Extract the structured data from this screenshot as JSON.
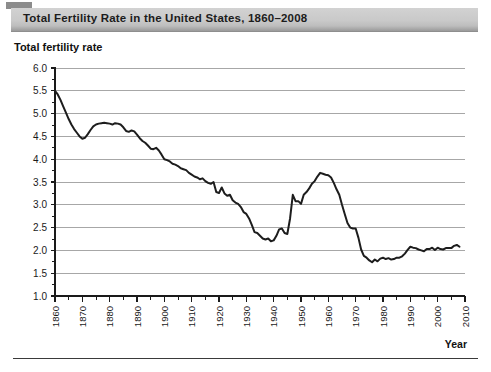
{
  "header": {
    "band_title": "Total Fertility Rate in the United States, 1860–2008"
  },
  "axes": {
    "y_axis_title": "Total fertility rate",
    "x_axis_title": "Year"
  },
  "chart_data": {
    "type": "line",
    "title": "Total Fertility Rate in the United States, 1860–2008",
    "xlabel": "Year",
    "ylabel": "Total fertility rate",
    "xlim": [
      1860,
      2010
    ],
    "ylim": [
      1.0,
      6.0
    ],
    "y_ticks": [
      1.0,
      1.5,
      2.0,
      2.5,
      3.0,
      3.5,
      4.0,
      4.5,
      5.0,
      5.5,
      6.0
    ],
    "y_tick_labels": [
      "1.0",
      "1.5",
      "2.0",
      "2.5",
      "3.0",
      "3.5",
      "4.0",
      "4.5",
      "5.0",
      "5.5",
      "6.0"
    ],
    "x_ticks": [
      1860,
      1870,
      1880,
      1890,
      1900,
      1910,
      1920,
      1930,
      1940,
      1950,
      1960,
      1970,
      1980,
      1990,
      2000,
      2010
    ],
    "x_tick_labels": [
      "1860",
      "1870",
      "1880",
      "1890",
      "1900",
      "1910",
      "1920",
      "1930",
      "1940",
      "1950",
      "1960",
      "1970",
      "1980",
      "1990",
      "2000",
      "2010"
    ],
    "x_minor_tick_step": 5,
    "grid": "horizontal",
    "legend": "none",
    "line_color": "#1d1d1d",
    "series": [
      {
        "name": "Total fertility rate",
        "x": [
          1860,
          1861,
          1862,
          1863,
          1864,
          1865,
          1866,
          1867,
          1868,
          1869,
          1870,
          1871,
          1872,
          1873,
          1874,
          1875,
          1876,
          1877,
          1878,
          1879,
          1880,
          1881,
          1882,
          1883,
          1884,
          1885,
          1886,
          1887,
          1888,
          1889,
          1890,
          1891,
          1892,
          1893,
          1894,
          1895,
          1896,
          1897,
          1898,
          1899,
          1900,
          1901,
          1902,
          1903,
          1904,
          1905,
          1906,
          1907,
          1908,
          1909,
          1910,
          1911,
          1912,
          1913,
          1914,
          1915,
          1916,
          1917,
          1918,
          1919,
          1920,
          1921,
          1922,
          1923,
          1924,
          1925,
          1926,
          1927,
          1928,
          1929,
          1930,
          1931,
          1932,
          1933,
          1934,
          1935,
          1936,
          1937,
          1938,
          1939,
          1940,
          1941,
          1942,
          1943,
          1944,
          1945,
          1946,
          1947,
          1948,
          1949,
          1950,
          1951,
          1952,
          1953,
          1954,
          1955,
          1956,
          1957,
          1958,
          1959,
          1960,
          1961,
          1962,
          1963,
          1964,
          1965,
          1966,
          1967,
          1968,
          1969,
          1970,
          1971,
          1972,
          1973,
          1974,
          1975,
          1976,
          1977,
          1978,
          1979,
          1980,
          1981,
          1982,
          1983,
          1984,
          1985,
          1986,
          1987,
          1988,
          1989,
          1990,
          1991,
          1992,
          1993,
          1994,
          1995,
          1996,
          1997,
          1998,
          1999,
          2000,
          2001,
          2002,
          2003,
          2004,
          2005,
          2006,
          2007,
          2008
        ],
        "values": [
          5.5,
          5.42,
          5.3,
          5.16,
          5.02,
          4.88,
          4.76,
          4.66,
          4.58,
          4.5,
          4.45,
          4.47,
          4.55,
          4.64,
          4.72,
          4.76,
          4.78,
          4.79,
          4.8,
          4.79,
          4.78,
          4.76,
          4.79,
          4.78,
          4.76,
          4.7,
          4.62,
          4.6,
          4.63,
          4.61,
          4.54,
          4.46,
          4.4,
          4.36,
          4.3,
          4.23,
          4.22,
          4.25,
          4.19,
          4.1,
          4.0,
          3.98,
          3.95,
          3.9,
          3.88,
          3.85,
          3.8,
          3.78,
          3.76,
          3.7,
          3.66,
          3.62,
          3.6,
          3.56,
          3.58,
          3.52,
          3.48,
          3.46,
          3.5,
          3.28,
          3.26,
          3.38,
          3.25,
          3.2,
          3.22,
          3.1,
          3.05,
          3.02,
          2.95,
          2.84,
          2.8,
          2.7,
          2.56,
          2.4,
          2.38,
          2.32,
          2.26,
          2.24,
          2.26,
          2.2,
          2.22,
          2.32,
          2.46,
          2.48,
          2.38,
          2.36,
          2.7,
          3.22,
          3.08,
          3.08,
          3.02,
          3.22,
          3.28,
          3.36,
          3.46,
          3.52,
          3.62,
          3.7,
          3.68,
          3.66,
          3.65,
          3.6,
          3.48,
          3.34,
          3.22,
          3.0,
          2.8,
          2.6,
          2.5,
          2.48,
          2.48,
          2.28,
          2.02,
          1.88,
          1.84,
          1.78,
          1.74,
          1.8,
          1.76,
          1.82,
          1.84,
          1.81,
          1.83,
          1.8,
          1.81,
          1.84,
          1.84,
          1.87,
          1.93,
          2.01,
          2.08,
          2.06,
          2.05,
          2.02,
          2.0,
          1.98,
          2.03,
          2.03,
          2.06,
          2.01,
          2.06,
          2.03,
          2.02,
          2.05,
          2.05,
          2.05,
          2.1,
          2.12,
          2.08
        ]
      }
    ]
  }
}
